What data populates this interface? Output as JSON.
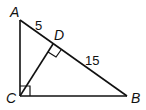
{
  "diagram": {
    "points": {
      "A": "A",
      "B": "B",
      "C": "C",
      "D": "D"
    },
    "segment_labels": {
      "AD": "5",
      "DB": "15"
    },
    "right_angles": [
      "C",
      "D"
    ]
  }
}
